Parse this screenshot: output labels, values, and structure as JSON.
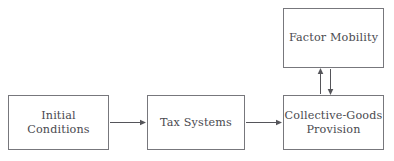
{
  "diagram": {
    "background_color": "#ffffff",
    "box_border_color": "#77777c",
    "text_color": "#4a4a4f",
    "edge_color": "#55555a",
    "nodes": [
      {
        "id": "initial_conditions",
        "label": "Initial Conditions"
      },
      {
        "id": "tax_systems",
        "label": "Tax Systems"
      },
      {
        "id": "collective_goods",
        "label": "Collective-Goods\nProvision"
      },
      {
        "id": "factor_mobility",
        "label": "Factor Mobility"
      }
    ],
    "edges": [
      {
        "id": "e1",
        "from": "initial_conditions",
        "to": "tax_systems",
        "direction": "right",
        "label": ""
      },
      {
        "id": "e2",
        "from": "tax_systems",
        "to": "collective_goods",
        "direction": "right",
        "label": ""
      },
      {
        "id": "e3",
        "from": "collective_goods",
        "to": "factor_mobility",
        "direction": "up",
        "label": ""
      },
      {
        "id": "e4",
        "from": "factor_mobility",
        "to": "collective_goods",
        "direction": "down",
        "label": ""
      }
    ]
  }
}
